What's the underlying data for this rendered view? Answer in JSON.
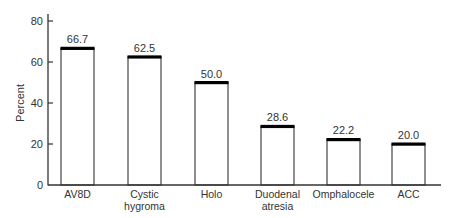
{
  "chart_data": {
    "type": "bar",
    "title": "",
    "xlabel": "",
    "ylabel": "Percent",
    "ylim": [
      0,
      85
    ],
    "yticks": [
      0,
      20,
      40,
      60,
      80
    ],
    "grid": false,
    "legend": null,
    "categories": [
      "AV8D",
      "Cystic hygroma",
      "Holo",
      "Duodenal atresia",
      "Omphalocele",
      "ACC"
    ],
    "category_lines": [
      [
        "AV8D"
      ],
      [
        "Cystic",
        "hygroma"
      ],
      [
        "Holo"
      ],
      [
        "Duodenal",
        "atresia"
      ],
      [
        "Omphalocele"
      ],
      [
        "ACC"
      ]
    ],
    "values": [
      66.7,
      62.5,
      50.0,
      28.6,
      22.2,
      20.0
    ],
    "value_labels": [
      "66.7",
      "62.5",
      "50.0",
      "28.6",
      "22.2",
      "20.0"
    ],
    "colors": {
      "bar_fill": "#ffffff",
      "bar_stroke": "#333333",
      "bar_cap": "#000000",
      "axis": "#333333"
    }
  }
}
